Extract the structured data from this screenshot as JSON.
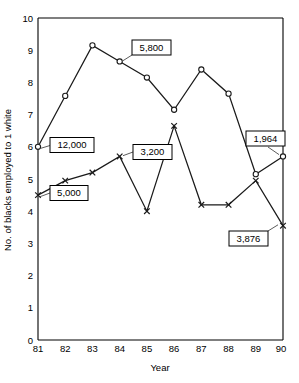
{
  "chart_data": {
    "type": "line",
    "title": "",
    "xlabel": "Year",
    "ylabel": "No. of blacks employed to 1 white",
    "categories": [
      "81",
      "82",
      "83",
      "84",
      "85",
      "86",
      "87",
      "88",
      "89",
      "90"
    ],
    "x": [
      81,
      82,
      83,
      84,
      85,
      86,
      87,
      88,
      89,
      90
    ],
    "xlim": [
      81,
      90
    ],
    "ylim": [
      0,
      10
    ],
    "yticks": [
      "0",
      "1",
      "2",
      "3",
      "4",
      "5",
      "6",
      "7",
      "8",
      "9",
      "10"
    ],
    "grid": false,
    "legend": "none",
    "series": [
      {
        "name": "circle-series",
        "marker": "circle",
        "values": [
          6.0,
          7.58,
          9.15,
          8.65,
          8.15,
          7.15,
          8.4,
          7.65,
          5.15,
          5.7
        ]
      },
      {
        "name": "cross-series",
        "marker": "cross",
        "values": [
          4.5,
          4.95,
          5.2,
          5.7,
          4.0,
          6.65,
          4.2,
          4.2,
          4.95,
          3.55
        ]
      }
    ],
    "annotations": [
      {
        "label": "12,000",
        "series": "circle-series",
        "year": 81,
        "value": 6.0
      },
      {
        "label": "5,000",
        "series": "cross-series",
        "year": 81,
        "value": 4.5
      },
      {
        "label": "5,800",
        "series": "circle-series",
        "year": 84,
        "value": 8.65
      },
      {
        "label": "3,200",
        "series": "cross-series",
        "year": 84,
        "value": 5.7
      },
      {
        "label": "1,964",
        "series": "circle-series",
        "year": 90,
        "value": 5.7
      },
      {
        "label": "3,876",
        "series": "cross-series",
        "year": 90,
        "value": 3.55
      }
    ]
  },
  "axes": {
    "y_title": "No. of blacks employed to 1 white",
    "x_title": "Year",
    "y_tick_0": "0",
    "y_tick_1": "1",
    "y_tick_2": "2",
    "y_tick_3": "3",
    "y_tick_4": "4",
    "y_tick_5": "5",
    "y_tick_6": "6",
    "y_tick_7": "7",
    "y_tick_8": "8",
    "y_tick_9": "9",
    "y_tick_10": "10",
    "x_tick_0": "81",
    "x_tick_1": "82",
    "x_tick_2": "83",
    "x_tick_3": "84",
    "x_tick_4": "85",
    "x_tick_5": "86",
    "x_tick_6": "87",
    "x_tick_7": "88",
    "x_tick_8": "89",
    "x_tick_9": "90"
  },
  "callouts": {
    "c12000": "12,000",
    "c5000": "5,000",
    "c5800": "5,800",
    "c3200": "3,200",
    "c1964": "1,964",
    "c3876": "3,876"
  },
  "colors": {
    "ink": "#1a1a1a",
    "background": "#ffffff",
    "leader": "#4a4a4a"
  }
}
